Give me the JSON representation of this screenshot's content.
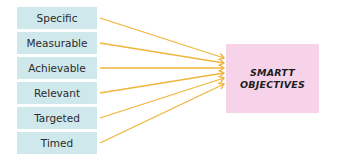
{
  "diagram": {
    "criteria": [
      {
        "label": "Specific"
      },
      {
        "label": "Measurable"
      },
      {
        "label": "Achievable"
      },
      {
        "label": "Relevant"
      },
      {
        "label": "Targeted"
      },
      {
        "label": "Timed"
      }
    ],
    "target": {
      "label": "SMARTT\nOBJECTIVES"
    },
    "colors": {
      "criteria_fill": "#cfe8ec",
      "target_fill": "#f7d3ea",
      "arrow": "#f0b43c"
    }
  }
}
